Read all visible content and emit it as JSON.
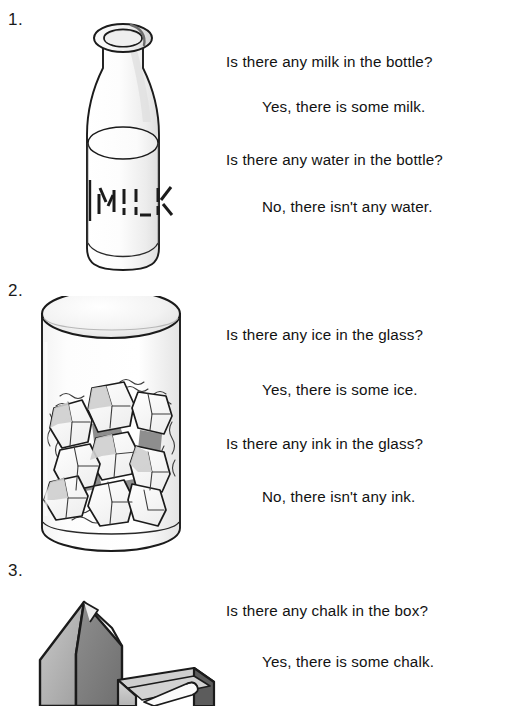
{
  "page": {
    "width": 515,
    "height": 706,
    "background": "#ffffff",
    "text_color": "#121212"
  },
  "exercises": [
    {
      "number": "1.",
      "illustration": "milk-bottle",
      "illustration_label": "MILK",
      "lines": [
        {
          "kind": "question",
          "text": "Is there any milk in the bottle?",
          "top": 53
        },
        {
          "kind": "answer",
          "text": "Yes, there is some milk.",
          "top": 98
        },
        {
          "kind": "question",
          "text": "Is there any water in the bottle?",
          "top": 151
        },
        {
          "kind": "answer",
          "text": "No, there isn't any water.",
          "top": 198
        }
      ]
    },
    {
      "number": "2.",
      "illustration": "glass-of-ice",
      "illustration_label": "",
      "lines": [
        {
          "kind": "question",
          "text": "Is there any ice in the glass?",
          "top": 326
        },
        {
          "kind": "answer",
          "text": "Yes, there is some ice.",
          "top": 381
        },
        {
          "kind": "question",
          "text": "Is there any ink in the glass?",
          "top": 435
        },
        {
          "kind": "answer",
          "text": "No, there isn't any ink.",
          "top": 488
        }
      ]
    },
    {
      "number": "3.",
      "illustration": "box-of-chalk",
      "illustration_label": "",
      "lines": [
        {
          "kind": "question",
          "text": "Is there any chalk in the box?",
          "top": 602
        },
        {
          "kind": "answer",
          "text": "Yes, there is some chalk.",
          "top": 653
        }
      ]
    }
  ],
  "colors": {
    "ink": "#121212",
    "outline": "#1b1b1b",
    "shade_light": "#f2f2f2",
    "shade_mid": "#d8d8d8",
    "shade_dark": "#9a9a9a",
    "shade_darker": "#7d7d7d"
  }
}
